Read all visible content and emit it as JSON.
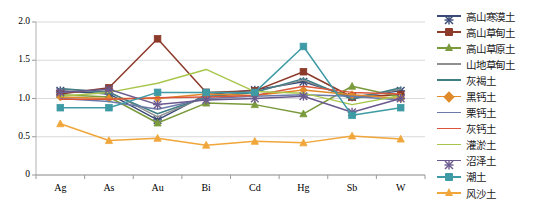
{
  "chart_data": {
    "type": "line",
    "title": "",
    "xlabel": "",
    "ylabel": "",
    "categories": [
      "Ag",
      "As",
      "Au",
      "Bi",
      "Cd",
      "Hg",
      "Sb",
      "W"
    ],
    "ylim": [
      0,
      2.0
    ],
    "yticks": [
      "0",
      "0.5",
      "1.0",
      "1.5",
      "2.0"
    ],
    "ytick_values": [
      0,
      0.5,
      1.0,
      1.5,
      2.0
    ],
    "grid": true,
    "legend_position": "right",
    "series": [
      {
        "name": "高山寒漠土",
        "color": "#3a4a76",
        "marker": "cross",
        "values": [
          1.1,
          1.06,
          0.72,
          1.05,
          1.11,
          1.22,
          1.02,
          1.1
        ]
      },
      {
        "name": "高山草甸土",
        "color": "#8c3a2a",
        "marker": "square",
        "values": [
          1.06,
          1.14,
          1.78,
          1.08,
          1.1,
          1.35,
          1.02,
          1.05
        ]
      },
      {
        "name": "高山草原土",
        "color": "#7a9a3c",
        "marker": "triangle",
        "values": [
          1.05,
          1.02,
          0.68,
          0.94,
          0.92,
          0.8,
          1.16,
          1.02
        ]
      },
      {
        "name": "山地草甸土",
        "color": "#8f8f8f",
        "marker": "line",
        "values": [
          1.12,
          1.09,
          0.76,
          1.03,
          1.09,
          1.24,
          1.0,
          1.12
        ]
      },
      {
        "name": "灰褐土",
        "color": "#3f7e84",
        "marker": "line",
        "values": [
          1.13,
          1.08,
          0.8,
          1.02,
          1.08,
          1.26,
          0.99,
          1.14
        ]
      },
      {
        "name": "黑钙土",
        "color": "#e08a29",
        "marker": "diamond",
        "values": [
          1.02,
          1.0,
          1.0,
          1.06,
          1.04,
          1.11,
          1.05,
          1.0
        ]
      },
      {
        "name": "栗钙土",
        "color": "#6b7aa8",
        "marker": "line",
        "values": [
          1.0,
          0.96,
          0.86,
          1.0,
          1.03,
          1.05,
          1.03,
          0.98
        ]
      },
      {
        "name": "灰钙土",
        "color": "#d9563c",
        "marker": "line",
        "values": [
          0.99,
          0.99,
          1.01,
          1.02,
          1.04,
          1.16,
          1.08,
          1.06
        ]
      },
      {
        "name": "灌淤土",
        "color": "#a8c64c",
        "marker": "line",
        "values": [
          1.03,
          1.08,
          1.2,
          1.38,
          1.09,
          1.07,
          0.92,
          1.04
        ]
      },
      {
        "name": "沼泽土",
        "color": "#6b5a8e",
        "marker": "cross",
        "values": [
          1.08,
          1.12,
          0.92,
          0.98,
          1.0,
          1.03,
          0.82,
          1.0
        ]
      },
      {
        "name": "潮土",
        "color": "#3e9aa5",
        "marker": "square",
        "values": [
          0.88,
          0.88,
          1.08,
          1.08,
          1.08,
          1.68,
          0.78,
          0.88
        ]
      },
      {
        "name": "风沙土",
        "color": "#f0a63a",
        "marker": "triangle",
        "values": [
          0.67,
          0.45,
          0.48,
          0.39,
          0.44,
          0.42,
          0.51,
          0.47
        ]
      }
    ]
  }
}
